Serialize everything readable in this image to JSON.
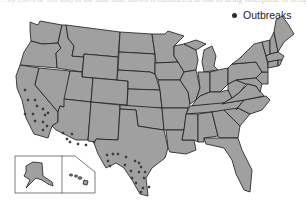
{
  "caption_cropped": "…ny (30% or 100 km) of the host state shown is considered at risk as being susceptible to being attacked.",
  "legend": {
    "label": "Outbreaks",
    "marker": "circle-dot",
    "color": "#2b2b2b"
  },
  "map": {
    "region": "United States (contiguous) with Alaska & Hawaii inset",
    "state_fill": "#a0a0a0",
    "border_color": "#1b1b1b",
    "outbreak_regions": [
      "California",
      "Arizona",
      "New Mexico",
      "Texas"
    ],
    "outbreak_points": [
      [
        25,
        90
      ],
      [
        28,
        100
      ],
      [
        35,
        100
      ],
      [
        37,
        106
      ],
      [
        43,
        109
      ],
      [
        45,
        115
      ],
      [
        48,
        113
      ],
      [
        25,
        114
      ],
      [
        33,
        114
      ],
      [
        35,
        121
      ],
      [
        43,
        122
      ],
      [
        47,
        126
      ],
      [
        43,
        130
      ],
      [
        63,
        133
      ],
      [
        67,
        139
      ],
      [
        70,
        142
      ],
      [
        72,
        134
      ],
      [
        78,
        144
      ],
      [
        86,
        145
      ],
      [
        94,
        142
      ],
      [
        107,
        155
      ],
      [
        113,
        154
      ],
      [
        118,
        154
      ],
      [
        108,
        161
      ],
      [
        110,
        166
      ],
      [
        126,
        157
      ],
      [
        135,
        161
      ],
      [
        139,
        163
      ],
      [
        125,
        165
      ],
      [
        141,
        167
      ],
      [
        131,
        171
      ],
      [
        139,
        172
      ],
      [
        145,
        172
      ],
      [
        132,
        178
      ],
      [
        144,
        178
      ],
      [
        136,
        183
      ],
      [
        143,
        188
      ],
      [
        141,
        192
      ],
      [
        149,
        187
      ]
    ]
  }
}
